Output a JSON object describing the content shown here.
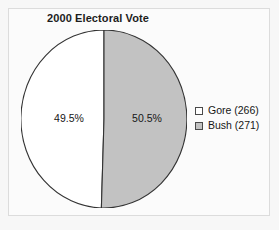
{
  "figure": {
    "background_color": "#f7f7f7",
    "panel_border_color": "#dcdcdc",
    "panel_background": "#fbfbfb"
  },
  "chart_data": {
    "type": "pie",
    "title": "2000 Electoral Vote",
    "xlabel": "",
    "ylabel": "",
    "grid": false,
    "legend_position": "right",
    "categories": [
      "Gore (266)",
      "Bush (271)"
    ],
    "values": [
      266,
      271
    ],
    "percent_labels": [
      "49.5%",
      "50.5%"
    ],
    "percentages": [
      49.5,
      50.5
    ],
    "total": 537,
    "start_angle_deg": 90,
    "direction": "counterclockwise",
    "slices": [
      {
        "name": "gore",
        "legend_label": "Gore (266)",
        "candidate": "Gore",
        "electoral_votes": 266,
        "percent": 49.5,
        "percent_label": "49.5%",
        "color": "#ffffff",
        "edge_color": "#333333"
      },
      {
        "name": "bush",
        "legend_label": "Bush (271)",
        "candidate": "Bush",
        "electoral_votes": 271,
        "percent": 50.5,
        "percent_label": "50.5%",
        "color": "#c2c2c2",
        "edge_color": "#333333"
      }
    ]
  },
  "legend": {
    "items": [
      {
        "label": "Gore (266)",
        "swatch_color": "#ffffff"
      },
      {
        "label": "Bush (271)",
        "swatch_color": "#c2c2c2"
      }
    ]
  }
}
